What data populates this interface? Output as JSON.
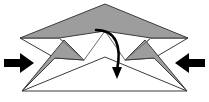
{
  "figure": {
    "title": "Origami fold step diagram",
    "canvas": {
      "width": 209,
      "height": 102
    },
    "colors": {
      "background": "#ffffff",
      "paper_fill": "#ffffff",
      "paper_shaded_fill": "#9d9d9d",
      "paper_outline": "#3b3b3b",
      "arrow_fill": "#000000",
      "fold_line": "#6b6b6b"
    },
    "shapes": [
      {
        "name": "upper-shaded-wing",
        "kind": "polygon",
        "fill": "paper_shaded_fill",
        "points": "105,4 188,38 151,38 105,31 59,38 20,38"
      },
      {
        "name": "left-lower-shaded-flap",
        "kind": "polygon",
        "fill": "paper_shaded_fill",
        "points": "22,91 64,40 84,60 55,58"
      },
      {
        "name": "right-lower-shaded-flap",
        "kind": "polygon",
        "fill": "paper_shaded_fill",
        "points": "187,91 145,40 125,60 154,58"
      },
      {
        "name": "left-white-inner-panel",
        "kind": "polygon",
        "fill": "paper_fill",
        "points": "20,38 59,38 84,60 55,58"
      },
      {
        "name": "right-white-inner-panel",
        "kind": "polygon",
        "fill": "paper_fill",
        "points": "188,38 151,38 125,60 154,58"
      },
      {
        "name": "bottom-white-triangle",
        "kind": "polygon",
        "fill": "paper_fill",
        "points": "22,91 105,57 187,91"
      }
    ],
    "fold_lines": [
      {
        "name": "left-center-fold",
        "from": "84,60",
        "to": "105,31"
      },
      {
        "name": "right-center-fold",
        "from": "125,60",
        "to": "105,31"
      },
      {
        "name": "left-wing-crease",
        "from": "59,38",
        "to": "84,60"
      },
      {
        "name": "right-wing-crease",
        "from": "151,38",
        "to": "125,60"
      }
    ],
    "arrows": [
      {
        "name": "left-push-arrow",
        "label": "push in from left",
        "direction": "right",
        "tip_x": 33,
        "tip_y": 63,
        "tail_x": 4,
        "tail_y": 63
      },
      {
        "name": "right-push-arrow",
        "label": "push in from right",
        "direction": "left",
        "tip_x": 176,
        "tip_y": 63,
        "tail_x": 205,
        "tail_y": 63
      },
      {
        "name": "fold-down-curved-arrow",
        "label": "fold top flap downward",
        "direction": "down",
        "start_x": 96,
        "start_y": 30,
        "end_x": 117,
        "end_y": 77
      }
    ]
  }
}
